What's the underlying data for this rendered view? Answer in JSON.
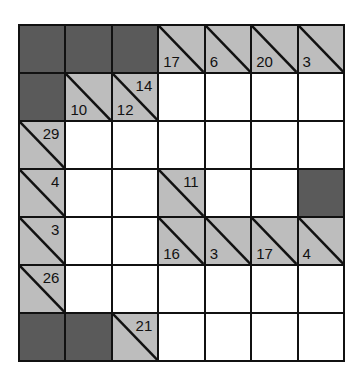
{
  "puzzle": {
    "type": "kakuro",
    "rows": 7,
    "cols": 7,
    "colors": {
      "block": "#5a5a5a",
      "clue": "#bdbdbd",
      "entry": "#ffffff",
      "line": "#111111"
    },
    "cells": [
      [
        {
          "t": "block"
        },
        {
          "t": "block"
        },
        {
          "t": "block"
        },
        {
          "t": "clue",
          "down": "17"
        },
        {
          "t": "clue",
          "down": "6"
        },
        {
          "t": "clue",
          "down": "20"
        },
        {
          "t": "clue",
          "down": "3"
        }
      ],
      [
        {
          "t": "block"
        },
        {
          "t": "clue",
          "down": "10"
        },
        {
          "t": "clue",
          "down": "12",
          "across": "14"
        },
        {
          "t": "entry"
        },
        {
          "t": "entry"
        },
        {
          "t": "entry"
        },
        {
          "t": "entry"
        }
      ],
      [
        {
          "t": "clue",
          "across": "29"
        },
        {
          "t": "entry"
        },
        {
          "t": "entry"
        },
        {
          "t": "entry"
        },
        {
          "t": "entry"
        },
        {
          "t": "entry"
        },
        {
          "t": "entry"
        }
      ],
      [
        {
          "t": "clue",
          "across": "4"
        },
        {
          "t": "entry"
        },
        {
          "t": "entry"
        },
        {
          "t": "clue",
          "across": "11"
        },
        {
          "t": "entry"
        },
        {
          "t": "entry"
        },
        {
          "t": "block"
        }
      ],
      [
        {
          "t": "clue",
          "across": "3"
        },
        {
          "t": "entry"
        },
        {
          "t": "entry"
        },
        {
          "t": "clue",
          "down": "16"
        },
        {
          "t": "clue",
          "down": "3"
        },
        {
          "t": "clue",
          "down": "17"
        },
        {
          "t": "clue",
          "down": "4"
        }
      ],
      [
        {
          "t": "clue",
          "across": "26"
        },
        {
          "t": "entry"
        },
        {
          "t": "entry"
        },
        {
          "t": "entry"
        },
        {
          "t": "entry"
        },
        {
          "t": "entry"
        },
        {
          "t": "entry"
        }
      ],
      [
        {
          "t": "block"
        },
        {
          "t": "block"
        },
        {
          "t": "clue",
          "across": "21"
        },
        {
          "t": "entry"
        },
        {
          "t": "entry"
        },
        {
          "t": "entry"
        },
        {
          "t": "entry"
        }
      ]
    ]
  }
}
